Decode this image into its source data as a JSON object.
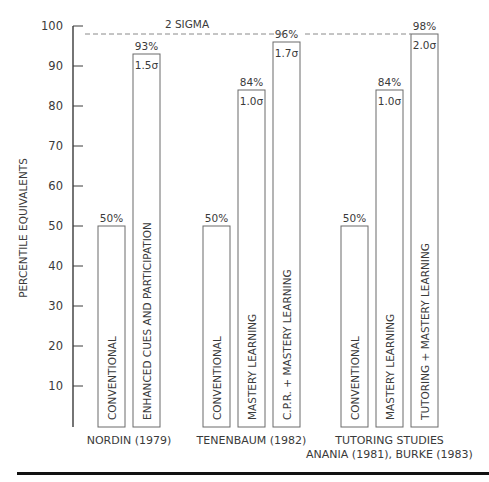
{
  "chart_data": {
    "type": "bar",
    "title": "",
    "xlabel": "",
    "ylabel": "PERCENTILE EQUIVALENTS",
    "ylim": [
      0,
      100
    ],
    "yticks": [
      10,
      20,
      30,
      40,
      50,
      60,
      70,
      80,
      90,
      100
    ],
    "grid": false,
    "reference_line": {
      "value": 98,
      "label": "2 SIGMA",
      "style": "dashed"
    },
    "groups": [
      {
        "label_lines": [
          "NORDIN (1979)"
        ],
        "bars": [
          {
            "category": "CONVENTIONAL",
            "value": 50,
            "value_label": "50%",
            "sigma_label": ""
          },
          {
            "category": "ENHANCED CUES AND PARTICIPATION",
            "value": 93,
            "value_label": "93%",
            "sigma_label": "1.5σ"
          }
        ]
      },
      {
        "label_lines": [
          "TENENBAUM (1982)"
        ],
        "bars": [
          {
            "category": "CONVENTIONAL",
            "value": 50,
            "value_label": "50%",
            "sigma_label": ""
          },
          {
            "category": "MASTERY LEARNING",
            "value": 84,
            "value_label": "84%",
            "sigma_label": "1.0σ"
          },
          {
            "category": "C.P.R. + MASTERY LEARNING",
            "value": 96,
            "value_label": "96%",
            "sigma_label": "1.7σ"
          }
        ]
      },
      {
        "label_lines": [
          "TUTORING STUDIES",
          "ANANIA (1981), BURKE (1983)"
        ],
        "bars": [
          {
            "category": "CONVENTIONAL",
            "value": 50,
            "value_label": "50%",
            "sigma_label": ""
          },
          {
            "category": "MASTERY LEARNING",
            "value": 84,
            "value_label": "84%",
            "sigma_label": "1.0σ"
          },
          {
            "category": "TUTORING + MASTERY LEARNING",
            "value": 98,
            "value_label": "98%",
            "sigma_label": "2.0σ"
          }
        ]
      }
    ]
  },
  "colors": {
    "ink": "#3a3a3a",
    "bar_stroke": "#6a6a6a",
    "dash": "#8a8a8a",
    "rule": "#111111"
  }
}
